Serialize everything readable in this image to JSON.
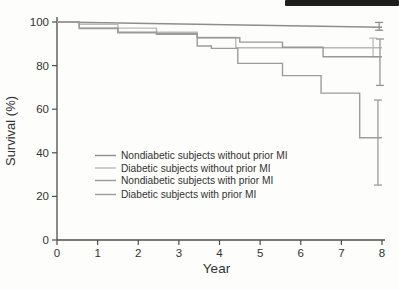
{
  "colors": {
    "background": "#fdfdfb",
    "axis": "#4d4d4d",
    "text": "#333333",
    "scan_bar": "#1e1e1e"
  },
  "chart_data": {
    "type": "line",
    "title": "",
    "xlabel": "Year",
    "ylabel": "Survival (%)",
    "xlim": [
      0,
      8
    ],
    "ylim": [
      0,
      100
    ],
    "x_ticks": [
      0,
      1,
      2,
      3,
      4,
      5,
      6,
      7,
      8
    ],
    "y_ticks": [
      0,
      20,
      40,
      60,
      80,
      100
    ],
    "grid": false,
    "legend_position": "inside-center-left",
    "series": [
      {
        "name": "Nondiabetic subjects without prior MI",
        "color": "#8d8d8d",
        "step": false,
        "points": [
          [
            0,
            100
          ],
          [
            8,
            97.6
          ]
        ],
        "error_bar": {
          "x": 7.93,
          "low": 96.2,
          "high": 99.8
        }
      },
      {
        "name": "Diabetic subjects without prior MI",
        "color": "#b9b9b9",
        "step": true,
        "points": [
          [
            0,
            100
          ],
          [
            0.55,
            99.0
          ],
          [
            1.5,
            97.2
          ],
          [
            2.45,
            95.3
          ],
          [
            3.45,
            92.9
          ],
          [
            4.4,
            88.2
          ],
          [
            8,
            88.2
          ]
        ],
        "error_bar": {
          "x": 7.78,
          "low": 84.1,
          "high": 92.6
        }
      },
      {
        "name": "Nondiabetic subjects with prior MI",
        "color": "#989898",
        "step": true,
        "points": [
          [
            0,
            100
          ],
          [
            0.55,
            97.2
          ],
          [
            1.5,
            95.3
          ],
          [
            2.45,
            94.6
          ],
          [
            3.45,
            92.8
          ],
          [
            4.5,
            90.8
          ],
          [
            5.55,
            88.4
          ],
          [
            6.55,
            84.1
          ],
          [
            8,
            84.1
          ]
        ],
        "error_bar": {
          "x": 7.95,
          "low": 70.9,
          "high": 92.2
        }
      },
      {
        "name": "Diabetic subjects with prior MI",
        "color": "#9c9c9c",
        "step": true,
        "points": [
          [
            0,
            100
          ],
          [
            0.55,
            97.0
          ],
          [
            1.5,
            95.0
          ],
          [
            2.45,
            94.4
          ],
          [
            3.45,
            89.0
          ],
          [
            3.8,
            87.9
          ],
          [
            4.45,
            81.0
          ],
          [
            5.55,
            75.4
          ],
          [
            6.5,
            67.4
          ],
          [
            7.45,
            46.9
          ],
          [
            8,
            46.9
          ]
        ],
        "error_bar": {
          "x": 7.9,
          "low": 25.2,
          "high": 64.2
        }
      }
    ]
  }
}
